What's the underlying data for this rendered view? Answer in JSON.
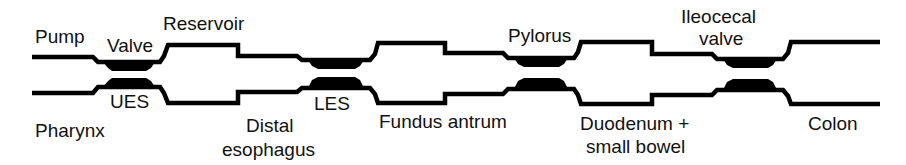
{
  "diagram": {
    "line_color": "#000000",
    "background": "#ffffff",
    "labels": {
      "pump": "Pump",
      "valve": "Valve",
      "reservoir": "Reservoir",
      "pylorus": "Pylorus",
      "ileocecal_1": "Ileocecal",
      "ileocecal_2": "valve",
      "pharynx": "Pharynx",
      "ues": "UES",
      "distal_1": "Distal",
      "distal_2": "esophagus",
      "les": "LES",
      "fundus": "Fundus antrum",
      "duodenum_1": "Duodenum +",
      "duodenum_2": "small bowel",
      "colon": "Colon"
    },
    "segments": [
      {
        "name": "Pharynx",
        "role": "Pump"
      },
      {
        "name": "UES",
        "role": "Valve"
      },
      {
        "name": "Distal esophagus",
        "role": "Reservoir"
      },
      {
        "name": "LES",
        "role": "Valve"
      },
      {
        "name": "Fundus antrum",
        "role": "Reservoir"
      },
      {
        "name": "Pylorus",
        "role": "Valve"
      },
      {
        "name": "Duodenum + small bowel",
        "role": "Reservoir"
      },
      {
        "name": "Ileocecal valve",
        "role": "Valve"
      },
      {
        "name": "Colon",
        "role": "Reservoir"
      }
    ]
  }
}
